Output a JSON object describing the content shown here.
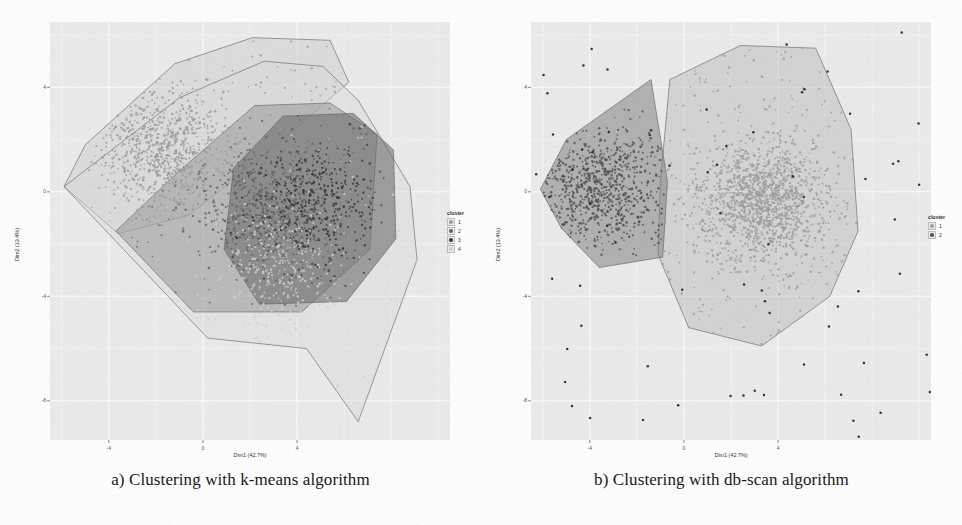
{
  "figure": {
    "panels": [
      {
        "id": "panel-a",
        "caption": "a) Clustering with k-means algorithm",
        "legend_title": "cluster",
        "legend_items": [
          {
            "label": "1",
            "color": "#9a9a9a"
          },
          {
            "label": "2",
            "color": "#5f5f5f"
          },
          {
            "label": "3",
            "color": "#2e2e2e"
          },
          {
            "label": "4",
            "color": "#cfcfcf"
          }
        ]
      },
      {
        "id": "panel-b",
        "caption": "b) Clustering with db-scan algorithm",
        "legend_title": "cluster",
        "legend_items": [
          {
            "label": "1",
            "color": "#9a9a9a"
          },
          {
            "label": "2",
            "color": "#4a4a4a"
          }
        ]
      }
    ]
  },
  "chart_data": [
    {
      "type": "scatter",
      "title": "a) Clustering with k-means algorithm",
      "xlabel": "Dim1 (42.7%)",
      "ylabel": "Dim2 (13.4%)",
      "xlim": [
        -6.5,
        10.5
      ],
      "ylim": [
        -9.5,
        6.5
      ],
      "xticks": [
        -4,
        0,
        4
      ],
      "xticklabels": [
        "-4",
        "0",
        "4"
      ],
      "yticks": [
        4,
        0,
        -4,
        -8
      ],
      "yticklabels": [
        "4",
        "0",
        "-4",
        "-8"
      ],
      "grid": true,
      "legend_position": "right",
      "legend_title": "cluster",
      "n_points_approx": 2500,
      "series": [
        {
          "name": "1",
          "cluster": 1,
          "color": "#9a9a9a",
          "hull_fill": "#c9c9c9",
          "hull_opacity": 0.45,
          "n_points_approx": 900,
          "centroid": [
            -1.6,
            1.6
          ],
          "hull": [
            [
              -5.9,
              0.2
            ],
            [
              -5.0,
              1.8
            ],
            [
              -1.2,
              4.9
            ],
            [
              2.1,
              5.9
            ],
            [
              5.4,
              5.8
            ],
            [
              6.2,
              4.2
            ],
            [
              3.4,
              2.0
            ],
            [
              -0.6,
              -0.9
            ],
            [
              -3.6,
              -1.6
            ]
          ]
        },
        {
          "name": "2",
          "cluster": 2,
          "color": "#5f5f5f",
          "hull_fill": "#8f8f8f",
          "hull_opacity": 0.5,
          "n_points_approx": 700,
          "centroid": [
            2.6,
            -0.6
          ],
          "hull": [
            [
              -3.7,
              -1.5
            ],
            [
              -1.0,
              0.8
            ],
            [
              2.2,
              3.3
            ],
            [
              5.4,
              3.4
            ],
            [
              7.4,
              2.2
            ],
            [
              7.1,
              -2.2
            ],
            [
              4.2,
              -4.6
            ],
            [
              -0.4,
              -4.6
            ],
            [
              -1.9,
              -3.2
            ]
          ]
        },
        {
          "name": "3",
          "cluster": 3,
          "color": "#2e2e2e",
          "hull_fill": "#6b6b6b",
          "hull_opacity": 0.6,
          "n_points_approx": 500,
          "centroid": [
            4.6,
            -0.4
          ],
          "hull": [
            [
              1.3,
              0.9
            ],
            [
              3.4,
              2.9
            ],
            [
              6.4,
              3.0
            ],
            [
              8.1,
              1.6
            ],
            [
              8.2,
              -1.8
            ],
            [
              6.1,
              -4.2
            ],
            [
              2.4,
              -4.3
            ],
            [
              0.9,
              -2.2
            ]
          ]
        },
        {
          "name": "4",
          "cluster": 4,
          "color": "#cfcfcf",
          "hull_fill": "#d8d8d8",
          "hull_opacity": 0.42,
          "n_points_approx": 400,
          "centroid": [
            3.2,
            -2.8
          ],
          "hull": [
            [
              -5.9,
              0.2
            ],
            [
              -1.0,
              3.6
            ],
            [
              2.6,
              5.0
            ],
            [
              5.1,
              4.8
            ],
            [
              6.6,
              3.5
            ],
            [
              8.8,
              0.2
            ],
            [
              9.1,
              -2.6
            ],
            [
              6.6,
              -8.8
            ],
            [
              4.4,
              -6.0
            ],
            [
              0.2,
              -5.6
            ]
          ]
        }
      ]
    },
    {
      "type": "scatter",
      "title": "b) Clustering with db-scan algorithm",
      "xlabel": "Dim1 (42.7%)",
      "ylabel": "Dim2 (13.4%)",
      "xlim": [
        -6.5,
        10.5
      ],
      "ylim": [
        -9.5,
        6.5
      ],
      "xticks": [
        -4,
        0,
        4
      ],
      "xticklabels": [
        "-4",
        "0",
        "4"
      ],
      "yticks": [
        4,
        0,
        -4,
        -8
      ],
      "yticklabels": [
        "4",
        "0",
        "-4",
        "-8"
      ],
      "grid": true,
      "legend_position": "right",
      "legend_title": "cluster",
      "n_points_approx": 2500,
      "series": [
        {
          "name": "1",
          "cluster": 1,
          "color": "#9a9a9a",
          "hull_fill": "#b5b5b5",
          "hull_opacity": 0.45,
          "n_points_approx": 1700,
          "centroid": [
            3.3,
            -0.4
          ],
          "hull": [
            [
              -0.6,
              4.3
            ],
            [
              2.4,
              5.6
            ],
            [
              5.6,
              5.5
            ],
            [
              7.1,
              2.4
            ],
            [
              7.4,
              -1.5
            ],
            [
              6.2,
              -4.0
            ],
            [
              3.3,
              -5.9
            ],
            [
              0.2,
              -5.2
            ],
            [
              -1.1,
              -2.4
            ],
            [
              -1.0,
              0.4
            ]
          ]
        },
        {
          "name": "2",
          "cluster": 2,
          "color": "#4a4a4a",
          "hull_fill": "#7d7d7d",
          "hull_opacity": 0.55,
          "n_points_approx": 800,
          "centroid": [
            -3.6,
            0.1
          ],
          "hull": [
            [
              -6.1,
              0.1
            ],
            [
              -5.0,
              2.0
            ],
            [
              -1.4,
              4.3
            ],
            [
              -0.7,
              0.4
            ],
            [
              -0.9,
              -2.5
            ],
            [
              -3.6,
              -2.9
            ],
            [
              -5.2,
              -1.4
            ]
          ]
        }
      ],
      "noise_points_approx": 70
    }
  ]
}
